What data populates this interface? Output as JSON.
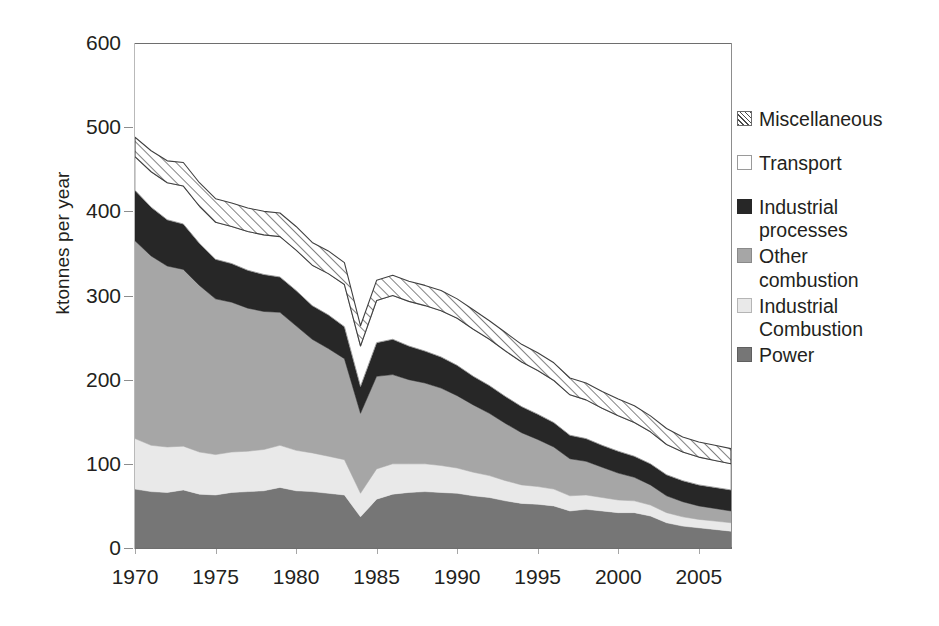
{
  "chart_data": {
    "type": "area",
    "stacked": true,
    "title": "",
    "subtitle": "",
    "xlabel": "",
    "ylabel": "ktonnes per year",
    "ylim": [
      0,
      600
    ],
    "yticks": [
      0,
      100,
      200,
      300,
      400,
      500,
      600
    ],
    "ytick_labels": [
      "0",
      "100",
      "200",
      "300",
      "400",
      "500",
      "600"
    ],
    "xlim": [
      1970,
      2007
    ],
    "xticks": [
      1970,
      1975,
      1980,
      1985,
      1990,
      1995,
      2000,
      2005
    ],
    "xtick_labels": [
      "1970",
      "1975",
      "1980",
      "1985",
      "1990",
      "1995",
      "2000",
      "2005"
    ],
    "grid": false,
    "legend_position": "right",
    "x": [
      1970,
      1971,
      1972,
      1973,
      1974,
      1975,
      1976,
      1977,
      1978,
      1979,
      1980,
      1981,
      1982,
      1983,
      1984,
      1985,
      1986,
      1987,
      1988,
      1989,
      1990,
      1991,
      1992,
      1993,
      1994,
      1995,
      1996,
      1997,
      1998,
      1999,
      2000,
      2001,
      2002,
      2003,
      2004,
      2005,
      2006,
      2007
    ],
    "series": [
      {
        "name": "Power",
        "color": "#767676",
        "pattern": "solid",
        "values": [
          70,
          67,
          66,
          69,
          64,
          63,
          66,
          67,
          68,
          72,
          68,
          67,
          65,
          63,
          37,
          58,
          64,
          66,
          67,
          66,
          65,
          62,
          60,
          56,
          53,
          52,
          50,
          44,
          46,
          44,
          42,
          42,
          38,
          30,
          26,
          24,
          22,
          20
        ]
      },
      {
        "name": "Industrial Combustion",
        "color": "#e9e9e9",
        "pattern": "solid",
        "values": [
          60,
          55,
          54,
          52,
          50,
          48,
          48,
          48,
          49,
          50,
          48,
          46,
          44,
          42,
          28,
          36,
          36,
          34,
          33,
          32,
          30,
          28,
          26,
          24,
          22,
          21,
          20,
          18,
          17,
          16,
          15,
          14,
          13,
          12,
          11,
          10,
          10,
          10
        ]
      },
      {
        "name": "Other combustion",
        "color": "#a6a6a6",
        "pattern": "solid",
        "values": [
          235,
          225,
          215,
          210,
          198,
          185,
          178,
          170,
          164,
          158,
          148,
          135,
          128,
          120,
          95,
          110,
          106,
          100,
          96,
          92,
          86,
          80,
          74,
          68,
          62,
          56,
          50,
          44,
          40,
          36,
          32,
          28,
          24,
          20,
          18,
          16,
          15,
          14
        ]
      },
      {
        "name": "Industrial processes",
        "color": "#272727",
        "pattern": "solid",
        "values": [
          60,
          58,
          55,
          54,
          50,
          47,
          46,
          45,
          44,
          42,
          42,
          40,
          40,
          38,
          32,
          40,
          42,
          40,
          38,
          37,
          36,
          34,
          33,
          32,
          31,
          30,
          29,
          28,
          27,
          26,
          26,
          25,
          25,
          25,
          25,
          25,
          25,
          25
        ]
      },
      {
        "name": "Transport",
        "color": "#ffffff",
        "pattern": "solid",
        "values": [
          40,
          42,
          44,
          45,
          44,
          44,
          44,
          46,
          47,
          48,
          48,
          48,
          49,
          50,
          48,
          50,
          52,
          53,
          54,
          55,
          56,
          56,
          55,
          54,
          53,
          52,
          50,
          48,
          46,
          44,
          42,
          40,
          38,
          36,
          34,
          33,
          32,
          31
        ]
      },
      {
        "name": "Miscellaneous",
        "color": "#ffffff",
        "pattern": "diagonal-hatch",
        "values": [
          23,
          25,
          26,
          28,
          28,
          28,
          28,
          28,
          28,
          28,
          28,
          27,
          27,
          26,
          24,
          24,
          24,
          24,
          24,
          24,
          23,
          23,
          22,
          22,
          21,
          21,
          21,
          20,
          20,
          20,
          20,
          20,
          19,
          19,
          18,
          18,
          18,
          18
        ]
      }
    ],
    "totals": [
      488,
      472,
      460,
      458,
      434,
      415,
      410,
      404,
      400,
      398,
      382,
      363,
      353,
      339,
      264,
      318,
      324,
      317,
      312,
      306,
      296,
      283,
      270,
      256,
      242,
      232,
      220,
      202,
      196,
      186,
      177,
      169,
      157,
      142,
      132,
      126,
      122,
      118
    ]
  },
  "legend": {
    "items": [
      {
        "label": "Miscellaneous",
        "swatch": "misc"
      },
      {
        "label": "Transport",
        "swatch": "transport"
      },
      {
        "label": "Industrial\nprocesses",
        "swatch": "indproc"
      },
      {
        "label": "Other\ncombustion",
        "swatch": "othercomb"
      },
      {
        "label": "Industrial\nCombustion",
        "swatch": "indcomb"
      },
      {
        "label": "Power",
        "swatch": "power"
      }
    ]
  },
  "colors": {
    "power": "#767676",
    "industrial_combustion": "#e9e9e9",
    "other_combustion": "#a6a6a6",
    "industrial_processes": "#272727",
    "transport": "#ffffff",
    "miscellaneous_hatch": "#4a4a4a",
    "axis": "#6e6e6e",
    "text": "#231f20"
  }
}
